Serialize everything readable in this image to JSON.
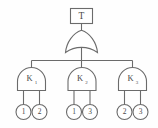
{
  "figure": {
    "name": "fault-tree-diagram",
    "background_color": "#fefefe",
    "line_color": "#6b6b6b",
    "text_color": "#4a4a4a"
  },
  "top_event": {
    "label": "T",
    "shape": "rectangle"
  },
  "top_gate": {
    "type": "OR",
    "label": ""
  },
  "intermediate_gates": [
    {
      "label": "K",
      "subscript": "1",
      "type": "AND",
      "inputs": [
        "1",
        "2"
      ]
    },
    {
      "label": "K",
      "subscript": "2",
      "type": "AND",
      "inputs": [
        "1",
        "3"
      ]
    },
    {
      "label": "K",
      "subscript": "3",
      "type": "AND",
      "inputs": [
        "2",
        "3"
      ]
    }
  ],
  "basic_events": [
    {
      "label": "1"
    },
    {
      "label": "2"
    },
    {
      "label": "1"
    },
    {
      "label": "3"
    },
    {
      "label": "2"
    },
    {
      "label": "3"
    }
  ]
}
